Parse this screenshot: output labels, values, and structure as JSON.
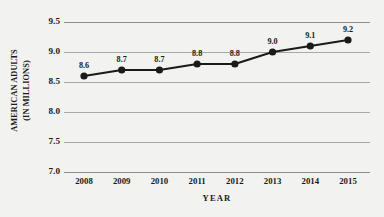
{
  "chart_data": {
    "type": "line",
    "title": "",
    "subtitle": "",
    "xlabel": "YEAR",
    "ylabel": "AMERICAN ADULTS (IN MILLIONS)",
    "ylabel_line1": "AMERICAN ADULTS",
    "ylabel_line2": "(IN MILLIONS)",
    "categories": [
      "2008",
      "2009",
      "2010",
      "2011",
      "2012",
      "2013",
      "2014",
      "2015"
    ],
    "x": [
      2008,
      2009,
      2010,
      2011,
      2012,
      2013,
      2014,
      2015
    ],
    "values": [
      8.6,
      8.7,
      8.7,
      8.8,
      8.8,
      9.0,
      9.1,
      9.2
    ],
    "point_labels": [
      "8.6",
      "8.7",
      "8.7",
      "8.8",
      "8.8",
      "9.0",
      "9.1",
      "9.2"
    ],
    "ylim": [
      7.0,
      9.5
    ],
    "yticks": [
      9.5,
      9.0,
      8.5,
      8.0,
      7.5,
      7.0
    ],
    "ytick_labels": [
      "9.5",
      "9.0",
      "8.5",
      "8.0",
      "7.5",
      "7.0"
    ],
    "grid": true,
    "grid_axis": "y",
    "legend": false,
    "legend_position": "none",
    "series": [
      {
        "name": "American adults",
        "values": [
          8.6,
          8.7,
          8.7,
          8.8,
          8.8,
          9.0,
          9.1,
          9.2
        ],
        "marker": "filled-circle",
        "line_color": "#1a1a1a",
        "marker_color": "#1a1a1a"
      }
    ]
  },
  "colors": {
    "background": "#f2f2f0",
    "line": "#1a1a1a",
    "marker": "#1a1a1a",
    "gridline": "#a8a8a8",
    "axis_rule": "#8e8e8e",
    "text": "#1a1a1a"
  }
}
